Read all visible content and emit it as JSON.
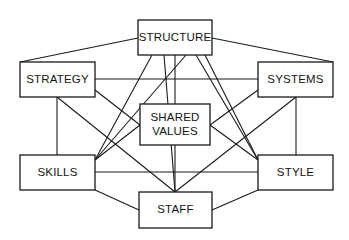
{
  "diagram": {
    "type": "network-diagram",
    "background_color": "#ffffff",
    "line_color": "#1a1a1a",
    "box_fill_color": "#ffffff",
    "text_color": "#141414",
    "nodes": [
      {
        "id": "structure",
        "label": "STRUCTURE",
        "lines": [
          "STRUCTURE"
        ],
        "x": 138,
        "y": 20,
        "width": 74,
        "height": 35
      },
      {
        "id": "strategy",
        "label": "STRATEGY",
        "lines": [
          "STRATEGY"
        ],
        "x": 20,
        "y": 62,
        "width": 75,
        "height": 35
      },
      {
        "id": "systems",
        "label": "SYSTEMS",
        "lines": [
          "SYSTEMS"
        ],
        "x": 258,
        "y": 62,
        "width": 75,
        "height": 35
      },
      {
        "id": "shared-values",
        "label": "SHARED VALUES",
        "lines": [
          "SHARED",
          "VALUES"
        ],
        "x": 140,
        "y": 104,
        "width": 70,
        "height": 41
      },
      {
        "id": "skills",
        "label": "SKILLS",
        "lines": [
          "SKILLS"
        ],
        "x": 20,
        "y": 155,
        "width": 75,
        "height": 35
      },
      {
        "id": "style",
        "label": "STYLE",
        "lines": [
          "STYLE"
        ],
        "x": 258,
        "y": 155,
        "width": 75,
        "height": 35
      },
      {
        "id": "staff",
        "label": "STAFF",
        "lines": [
          "STAFF"
        ],
        "x": 139,
        "y": 192,
        "width": 73,
        "height": 36
      }
    ],
    "edges": [
      {
        "id": "strategy-structure",
        "from": "strategy",
        "to": "structure",
        "x1": 20,
        "y1": 62,
        "x2": 138,
        "y2": 38
      },
      {
        "id": "structure-systems",
        "from": "structure",
        "to": "systems",
        "x1": 212,
        "y1": 38,
        "x2": 333,
        "y2": 62
      },
      {
        "id": "strategy-systems",
        "from": "strategy",
        "to": "systems",
        "x1": 95,
        "y1": 79,
        "x2": 258,
        "y2": 79
      },
      {
        "id": "strategy-skills",
        "from": "strategy",
        "to": "skills",
        "x1": 57,
        "y1": 97,
        "x2": 57,
        "y2": 155
      },
      {
        "id": "systems-style",
        "from": "systems",
        "to": "style",
        "x1": 296,
        "y1": 97,
        "x2": 296,
        "y2": 155
      },
      {
        "id": "skills-style",
        "from": "skills",
        "to": "style",
        "x1": 95,
        "y1": 172,
        "x2": 258,
        "y2": 172
      },
      {
        "id": "skills-staff",
        "from": "skills",
        "to": "staff",
        "x1": 95,
        "y1": 190,
        "x2": 139,
        "y2": 210
      },
      {
        "id": "staff-style",
        "from": "staff",
        "to": "style",
        "x1": 212,
        "y1": 210,
        "x2": 258,
        "y2": 190
      },
      {
        "id": "structure-sharedvalues",
        "from": "structure",
        "to": "shared-values",
        "x1": 175,
        "y1": 55,
        "x2": 175,
        "y2": 104
      },
      {
        "id": "sharedvalues-staff",
        "from": "shared-values",
        "to": "staff",
        "x1": 175,
        "y1": 145,
        "x2": 175,
        "y2": 192
      },
      {
        "id": "strategy-sharedvalues",
        "from": "strategy",
        "to": "shared-values",
        "x1": 95,
        "y1": 90,
        "x2": 140,
        "y2": 125
      },
      {
        "id": "systems-sharedvalues",
        "from": "systems",
        "to": "shared-values",
        "x1": 258,
        "y1": 90,
        "x2": 210,
        "y2": 125
      },
      {
        "id": "skills-sharedvalues",
        "from": "skills",
        "to": "shared-values",
        "x1": 95,
        "y1": 160,
        "x2": 140,
        "y2": 125
      },
      {
        "id": "style-sharedvalues",
        "from": "style",
        "to": "shared-values",
        "x1": 258,
        "y1": 160,
        "x2": 210,
        "y2": 125
      },
      {
        "id": "structure-skills",
        "from": "structure",
        "to": "skills",
        "x1": 152,
        "y1": 55,
        "x2": 95,
        "y2": 160
      },
      {
        "id": "structure-staff",
        "from": "structure",
        "to": "staff",
        "x1": 164,
        "y1": 55,
        "x2": 175,
        "y2": 192
      },
      {
        "id": "structure-style",
        "from": "structure",
        "to": "style",
        "x1": 205,
        "y1": 55,
        "x2": 258,
        "y2": 160
      },
      {
        "id": "strategy-staff",
        "from": "strategy",
        "to": "staff",
        "x1": 57,
        "y1": 97,
        "x2": 175,
        "y2": 192
      },
      {
        "id": "systems-staff",
        "from": "systems",
        "to": "staff",
        "x1": 296,
        "y1": 97,
        "x2": 175,
        "y2": 192
      },
      {
        "id": "skills-structure-upper",
        "from": "skills",
        "to": "structure",
        "x1": 95,
        "y1": 160,
        "x2": 186,
        "y2": 55
      },
      {
        "id": "style-structure-upper",
        "from": "style",
        "to": "structure",
        "x1": 258,
        "y1": 160,
        "x2": 196,
        "y2": 55
      }
    ]
  }
}
